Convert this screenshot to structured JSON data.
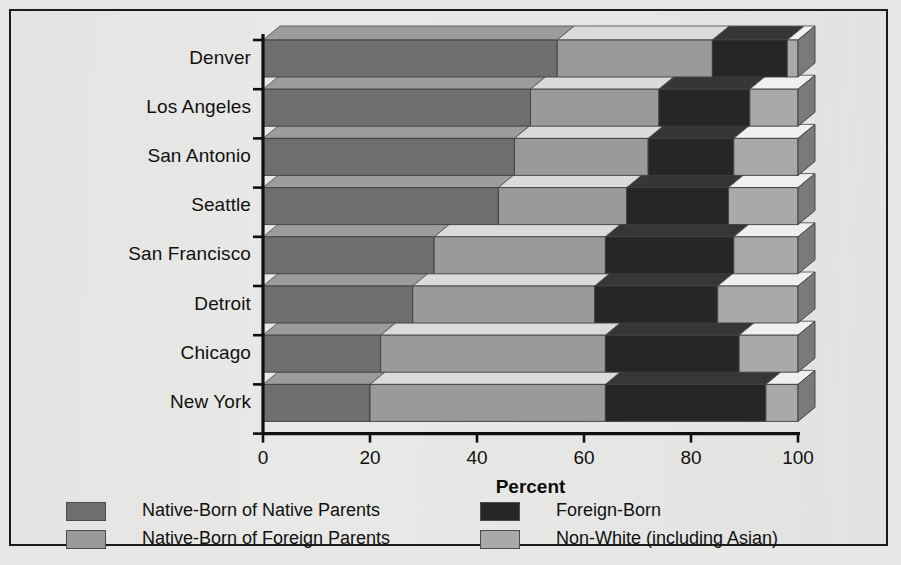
{
  "chart_data": {
    "type": "bar",
    "orientation": "horizontal",
    "stacked": true,
    "percent_stacked": true,
    "style": "3d-ribbon",
    "title": "",
    "xlabel": "Percent",
    "ylabel": "",
    "xlim": [
      0,
      100
    ],
    "xticks": [
      0,
      20,
      40,
      60,
      80,
      100
    ],
    "xtick_labels": [
      "0",
      "20",
      "40",
      "60",
      "80",
      "100"
    ],
    "grid": false,
    "legend_position": "bottom",
    "categories": [
      "Denver",
      "Los Angeles",
      "San Antonio",
      "Seattle",
      "San Francisco",
      "Detroit",
      "Chicago",
      "New York"
    ],
    "series": [
      {
        "name": "Native-Born of Native Parents",
        "color": "#6e6e6e",
        "values": [
          55,
          50,
          47,
          44,
          32,
          28,
          22,
          20
        ]
      },
      {
        "name": "Native-Born of Foreign Parents",
        "color": "#9a9a9a",
        "values": [
          29,
          24,
          25,
          24,
          32,
          34,
          42,
          44
        ]
      },
      {
        "name": "Foreign-Born",
        "color": "#262626",
        "values": [
          14,
          17,
          16,
          19,
          24,
          23,
          25,
          30
        ]
      },
      {
        "name": "Non-White (including Asian)",
        "color": "#a9a9a9",
        "values": [
          2,
          9,
          12,
          13,
          12,
          15,
          11,
          6
        ]
      }
    ]
  },
  "legend": {
    "items": [
      {
        "label": "Native-Born of Native Parents",
        "color": "#6e6e6e"
      },
      {
        "label": "Native-Born of Foreign Parents",
        "color": "#9a9a9a"
      },
      {
        "label": "Foreign-Born",
        "color": "#262626"
      },
      {
        "label": "Non-White (including Asian)",
        "color": "#a9a9a9"
      }
    ]
  }
}
